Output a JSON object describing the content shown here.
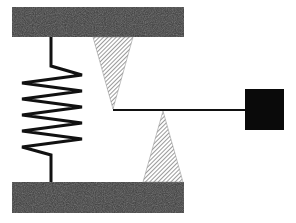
{
  "diagram": {
    "components": [
      {
        "id": "top-plate",
        "type": "fixed-support",
        "fill": "#3a3a3a"
      },
      {
        "id": "bottom-plate",
        "type": "fixed-support",
        "fill": "#3a3a3a"
      },
      {
        "id": "spring",
        "type": "spring",
        "coils": 5,
        "stroke": "#111111"
      },
      {
        "id": "upper-pivot",
        "type": "knife-edge",
        "pattern": "diagonal-hatch",
        "orientation": "pointing-down"
      },
      {
        "id": "lower-pivot",
        "type": "knife-edge",
        "pattern": "diagonal-hatch",
        "orientation": "pointing-up"
      },
      {
        "id": "lever-arm",
        "type": "rod",
        "stroke": "#111111"
      },
      {
        "id": "mass",
        "type": "block",
        "fill": "#0a0a0a"
      }
    ],
    "colors": {
      "plate": "#3a3a3a",
      "hatch_line": "#555555",
      "hatch_bg": "#ffffff",
      "line": "#111111",
      "mass": "#0a0a0a"
    }
  }
}
